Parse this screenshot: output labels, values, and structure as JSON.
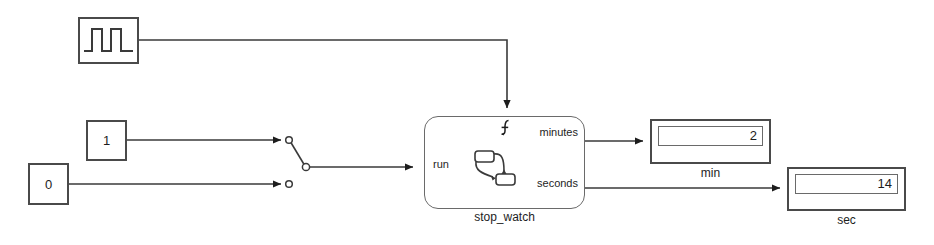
{
  "diagram": {
    "background_color": "#ffffff",
    "line_color": "#3a3a3a",
    "block_border_color": "#4a4a4a",
    "text_color": "#1d1d1d"
  },
  "blocks": {
    "pulse_generator": {
      "name": "pulse-generator-block",
      "icon": "square-wave-icon"
    },
    "constant_one": {
      "value": "1"
    },
    "constant_zero": {
      "value": "0"
    },
    "manual_switch": {
      "name": "manual-switch",
      "position": "upper",
      "inputs": [
        "1",
        "0"
      ]
    },
    "chart": {
      "caption": "stop_watch",
      "input_port": "run",
      "output_ports": [
        "minutes",
        "seconds"
      ],
      "trigger_icon": "function-call-trigger-icon",
      "body_icon": "stateflow-state-transition-icon"
    },
    "display_minutes": {
      "value": "2",
      "caption": "min"
    },
    "display_seconds": {
      "value": "14",
      "caption": "sec"
    }
  }
}
